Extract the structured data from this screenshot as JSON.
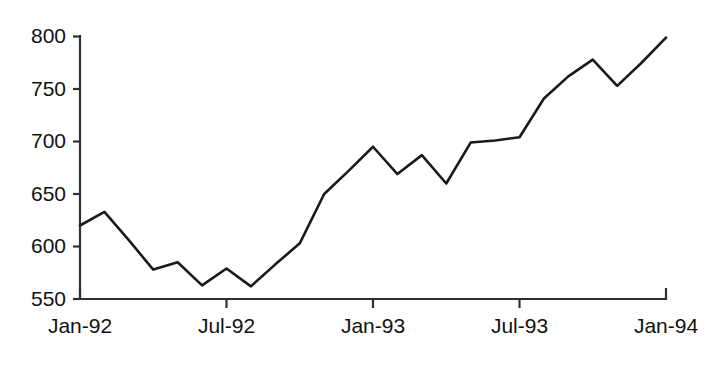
{
  "chart_data": {
    "type": "line",
    "title": "",
    "xlabel": "",
    "ylabel": "",
    "grid": false,
    "legend": "none",
    "ylim": [
      550,
      800
    ],
    "yticks": [
      550,
      600,
      650,
      700,
      750,
      800
    ],
    "ytick_labels": [
      "550",
      "600",
      "650",
      "700",
      "750",
      "800"
    ],
    "xtick_labels": [
      "Jan-92",
      "Jul-92",
      "Jan-93",
      "Jul-93",
      "Jan-94"
    ],
    "xtick_months": [
      "Jan-92",
      "Jul-92",
      "Jan-93",
      "Jul-93",
      "Jan-94"
    ],
    "x": [
      "Jan-92",
      "Feb-92",
      "Mar-92",
      "Apr-92",
      "May-92",
      "Jun-92",
      "Jul-92",
      "Aug-92",
      "Sep-92",
      "Oct-92",
      "Nov-92",
      "Dec-92",
      "Jan-93",
      "Feb-93",
      "Mar-93",
      "Apr-93",
      "May-93",
      "Jun-93",
      "Jul-93",
      "Aug-93",
      "Sep-93",
      "Oct-93",
      "Nov-93",
      "Dec-93",
      "Jan-94"
    ],
    "values": [
      620,
      633,
      606,
      578,
      585,
      563,
      579,
      562,
      583,
      603,
      650,
      672,
      695,
      669,
      687,
      660,
      699,
      701,
      704,
      741,
      762,
      778,
      753,
      775,
      799
    ],
    "series": [
      {
        "name": "series-1",
        "color": "#1a1a1a",
        "values": [
          620,
          633,
          606,
          578,
          585,
          563,
          579,
          562,
          583,
          603,
          650,
          672,
          695,
          669,
          687,
          660,
          699,
          701,
          704,
          741,
          762,
          778,
          753,
          775,
          799
        ]
      }
    ],
    "xlim_index": [
      0,
      24
    ]
  },
  "axes": {
    "axis_color": "#303030",
    "line_color": "#1a1a1a",
    "background": "#ffffff"
  }
}
